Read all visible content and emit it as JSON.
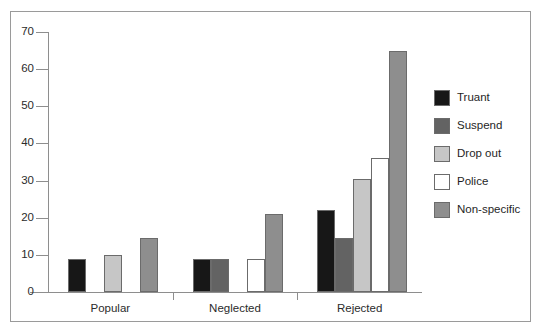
{
  "chart_data": {
    "type": "bar",
    "title": "",
    "subtitle": "",
    "xlabel": "",
    "ylabel": "",
    "ylim": [
      0,
      70
    ],
    "yticks": [
      0,
      10,
      20,
      30,
      40,
      50,
      60,
      70
    ],
    "ytick_labels": [
      "0",
      "10",
      "20",
      "30",
      "40",
      "50",
      "60",
      "70"
    ],
    "grid": false,
    "legend_position": "right",
    "categories": [
      "Popular",
      "Neglected",
      "Rejected"
    ],
    "series": [
      {
        "name": "Truant",
        "color": "#171717",
        "values": [
          9,
          9,
          22
        ]
      },
      {
        "name": "Suspend",
        "color": "#636363",
        "values": [
          0,
          9,
          14.5
        ]
      },
      {
        "name": "Drop out",
        "color": "#c6c6c6",
        "values": [
          10,
          0,
          30.5
        ]
      },
      {
        "name": "Police",
        "color": "#ffffff",
        "values": [
          0,
          9,
          36
        ]
      },
      {
        "name": "Non-specific",
        "color": "#8e8e8e",
        "values": [
          14.5,
          21,
          65
        ]
      }
    ]
  },
  "legend": {
    "items": [
      {
        "label": "Truant",
        "color": "#171717"
      },
      {
        "label": "Suspend",
        "color": "#636363"
      },
      {
        "label": "Drop out",
        "color": "#c6c6c6"
      },
      {
        "label": "Police",
        "color": "#ffffff"
      },
      {
        "label": "Non-specific",
        "color": "#8e8e8e"
      }
    ]
  },
  "axes": {
    "y_tick_labels": [
      "70",
      "60",
      "50",
      "40",
      "30",
      "20",
      "10",
      "0"
    ],
    "x_category_labels": [
      "Popular",
      "Neglected",
      "Rejected"
    ]
  }
}
